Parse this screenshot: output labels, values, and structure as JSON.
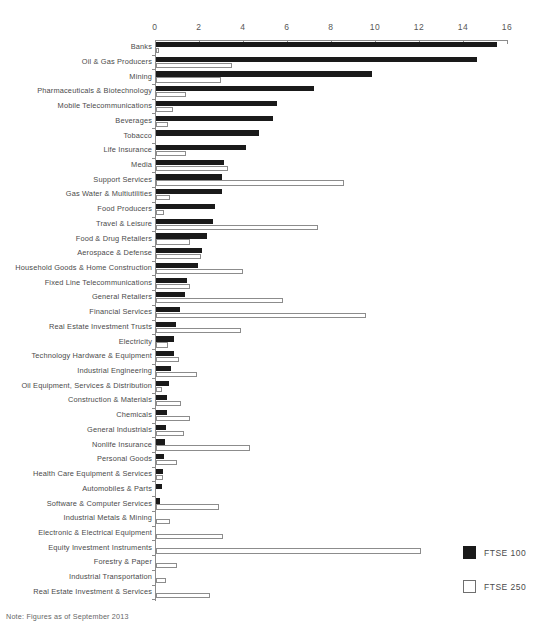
{
  "chart_data": {
    "type": "bar",
    "orientation": "horizontal",
    "title": "",
    "xlabel": "",
    "ylabel": "",
    "xlim": [
      0,
      16
    ],
    "xticks": [
      0,
      2,
      4,
      6,
      8,
      10,
      12,
      14,
      16
    ],
    "xtick_labels": [
      "0",
      "2",
      "4",
      "6",
      "8",
      "10",
      "12",
      "14",
      "16"
    ],
    "grid": false,
    "legend_position": "bottom-right",
    "categories": [
      "Banks",
      "Oil & Gas Producers",
      "Mining",
      "Pharmaceuticals & Biotechnology",
      "Mobile Telecommunications",
      "Beverages",
      "Tobacco",
      "Life Insurance",
      "Media",
      "Support Services",
      "Gas Water & Multiutilities",
      "Food Producers",
      "Travel & Leisure",
      "Food & Drug Retailers",
      "Aerospace & Defense",
      "Household Goods & Home Construction",
      "Fixed Line Telecommunications",
      "General Retailers",
      "Financial Services",
      "Real Estate Investment Trusts",
      "Electricity",
      "Technology Hardware & Equipment",
      "Industrial Engineering",
      "Oil Equipment, Services & Distribution",
      "Construction & Materials",
      "Chemicals",
      "General Industrials",
      "Nonlife Insurance",
      "Personal Goods",
      "Health Care Equipment & Services",
      "Automobiles & Parts",
      "Software & Computer Services",
      "Industrial Metals & Mining",
      "Electronic & Electrical Equipment",
      "Equity Investment Instruments",
      "Forestry & Paper",
      "Industrial Transportation",
      "Real Estate Investment & Services"
    ],
    "series": [
      {
        "name": "FTSE 100",
        "color": "#1a1a1a",
        "values": [
          15.5,
          14.6,
          9.8,
          7.2,
          5.5,
          5.3,
          4.7,
          4.1,
          3.1,
          3.0,
          3.0,
          2.7,
          2.6,
          2.3,
          2.1,
          1.9,
          1.4,
          1.3,
          1.1,
          0.9,
          0.8,
          0.8,
          0.7,
          0.6,
          0.5,
          0.5,
          0.45,
          0.4,
          0.35,
          0.3,
          0.25,
          0.2,
          0,
          0,
          0,
          0,
          0,
          0
        ]
      },
      {
        "name": "FTSE 250",
        "color": "#ffffff",
        "values": [
          0.2,
          3.5,
          3.0,
          1.4,
          0.8,
          0.6,
          0,
          1.4,
          3.3,
          8.6,
          0.7,
          0.4,
          7.4,
          1.6,
          2.1,
          4.0,
          1.6,
          5.8,
          9.6,
          3.9,
          0.6,
          1.1,
          1.9,
          0.3,
          1.2,
          1.6,
          1.3,
          4.3,
          1.0,
          0.35,
          0,
          2.9,
          0.7,
          3.1,
          12.1,
          1.0,
          0.5,
          2.5
        ]
      }
    ]
  },
  "legend": {
    "items": [
      {
        "label": "FTSE 100",
        "swatch": "filled-black"
      },
      {
        "label": "FTSE 250",
        "swatch": "outline-white"
      }
    ]
  },
  "footer": {
    "note": "Note: Figures as of September 2013"
  }
}
